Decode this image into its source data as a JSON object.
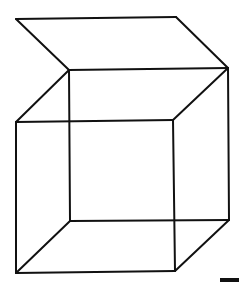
{
  "figure": {
    "title": "",
    "stroke_color": "#111111",
    "background_color": "#ffffff"
  },
  "vertices": {
    "lid_back_left": [
      16,
      19
    ],
    "lid_back_right": [
      176,
      17
    ],
    "back_top_left": [
      69,
      70
    ],
    "back_top_right": [
      228,
      68
    ],
    "front_top_left": [
      16,
      122
    ],
    "front_top_right": [
      173,
      120
    ],
    "back_bottom_left": [
      70,
      221
    ],
    "back_bottom_right": [
      229,
      220
    ],
    "front_bottom_left": [
      16,
      273
    ],
    "front_bottom_right": [
      175,
      271
    ]
  },
  "edges": [
    [
      "lid_back_left",
      "lid_back_right"
    ],
    [
      "lid_back_left",
      "back_top_left"
    ],
    [
      "lid_back_right",
      "back_top_right"
    ],
    [
      "back_top_left",
      "back_top_right"
    ],
    [
      "back_top_left",
      "front_top_left"
    ],
    [
      "back_top_right",
      "front_top_right"
    ],
    [
      "front_top_left",
      "front_top_right"
    ],
    [
      "back_top_left",
      "back_bottom_left"
    ],
    [
      "back_top_right",
      "back_bottom_right"
    ],
    [
      "front_top_left",
      "front_bottom_left"
    ],
    [
      "front_top_right",
      "front_bottom_right"
    ],
    [
      "back_bottom_left",
      "back_bottom_right"
    ],
    [
      "front_bottom_left",
      "front_bottom_right"
    ],
    [
      "back_bottom_left",
      "front_bottom_left"
    ],
    [
      "back_bottom_right",
      "front_bottom_right"
    ]
  ],
  "corner_mark": {
    "x": 220,
    "y": 278,
    "width": 19,
    "height": 4
  }
}
